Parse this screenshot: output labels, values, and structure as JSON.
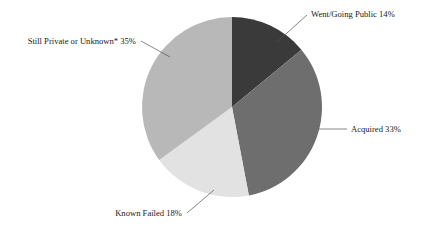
{
  "chart_data": {
    "type": "pie",
    "title": "",
    "subtitle": "",
    "xlabel": "",
    "ylabel": "",
    "legend_position": "none",
    "grid": false,
    "labels_as_shown": [
      "Went/Going Public 14%",
      "Acquired 33%",
      "Known Failed 18%",
      "Still Private or Unknown* 35%"
    ],
    "categories": [
      "Went/Going Public",
      "Acquired",
      "Known Failed",
      "Still Private or Unknown*"
    ],
    "values": [
      14,
      33,
      18,
      35
    ],
    "value_unit": "%",
    "total": 100,
    "start_angle_deg": 0,
    "direction": "clockwise",
    "colors": [
      "#3a3a3a",
      "#6e6e6e",
      "#e2e2e2",
      "#b8b8b8"
    ],
    "background_color": "#ffffff",
    "slices": [
      {
        "label": "Went/Going Public",
        "value": 14,
        "display": "Went/Going Public 14%",
        "color": "#3a3a3a",
        "label_x": 311,
        "label_y": 17,
        "anchor": "start",
        "leader_x1": 277,
        "leader_y1": 42,
        "leader_x2": 307,
        "leader_y2": 15
      },
      {
        "label": "Acquired",
        "value": 33,
        "display": "Acquired 33%",
        "color": "#6e6e6e",
        "label_x": 351,
        "label_y": 132,
        "anchor": "start",
        "leader_x1": 318,
        "leader_y1": 129,
        "leader_x2": 347,
        "leader_y2": 129
      },
      {
        "label": "Known Failed",
        "value": 18,
        "display": "Known Failed 18%",
        "color": "#e2e2e2",
        "label_x": 182,
        "label_y": 216,
        "anchor": "end",
        "leader_x1": 214,
        "leader_y1": 190,
        "leader_x2": 187,
        "leader_y2": 213
      },
      {
        "label": "Still Private or Unknown*",
        "value": 35,
        "display": "Still Private or Unknown* 35%",
        "color": "#b8b8b8",
        "label_x": 136,
        "label_y": 44,
        "anchor": "end",
        "leader_x1": 170,
        "leader_y1": 57,
        "leader_x2": 141,
        "leader_y2": 41
      }
    ],
    "geometry": {
      "center_x": 232,
      "center_y": 107,
      "radius": 90
    }
  }
}
